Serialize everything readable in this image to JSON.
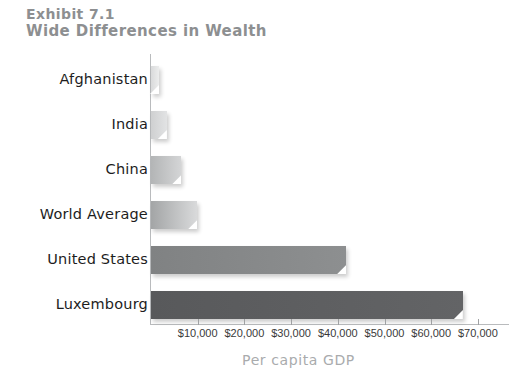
{
  "title": {
    "line1": "Exhibit 7.1",
    "line2": "Wide Differences in Wealth"
  },
  "chart_data": {
    "type": "bar",
    "orientation": "horizontal",
    "title": "Exhibit 7.1 Wide Differences in Wealth",
    "subtitle": "Wide Differences in Wealth",
    "xlabel": "Per capita GDP",
    "ylabel": "",
    "categories": [
      "Afghanistan",
      "India",
      "China",
      "World Average",
      "United States",
      "Luxembourg"
    ],
    "values": [
      1000,
      3400,
      6500,
      9900,
      41800,
      66800
    ],
    "xlim": [
      0,
      76900
    ],
    "xticks": [
      10000,
      20000,
      30000,
      40000,
      50000,
      60000,
      70000
    ],
    "xtick_labels": [
      "$10,000",
      "$20,000",
      "$30,000",
      "$40,000",
      "$50,000",
      "$60,000",
      "$70,000"
    ],
    "grid": false,
    "legend": false,
    "bar_colors": [
      "#d9dadb",
      "#cfd0d1",
      "#b3b5b6",
      "#a3a5a6",
      "#808283",
      "#58595b"
    ],
    "bar_gradient_ends": [
      "#eceded",
      "#e2e3e4",
      "#d4d5d6",
      "#d9dadb",
      "#8d8f90",
      "#636466"
    ]
  },
  "colors": {
    "title": "#8d8f91",
    "category_label": "#1d1d1d",
    "tick_label": "#3a3a3a",
    "axis_title": "#a9abad",
    "axis_line": "#b9bbbd",
    "background": "#ffffff"
  }
}
